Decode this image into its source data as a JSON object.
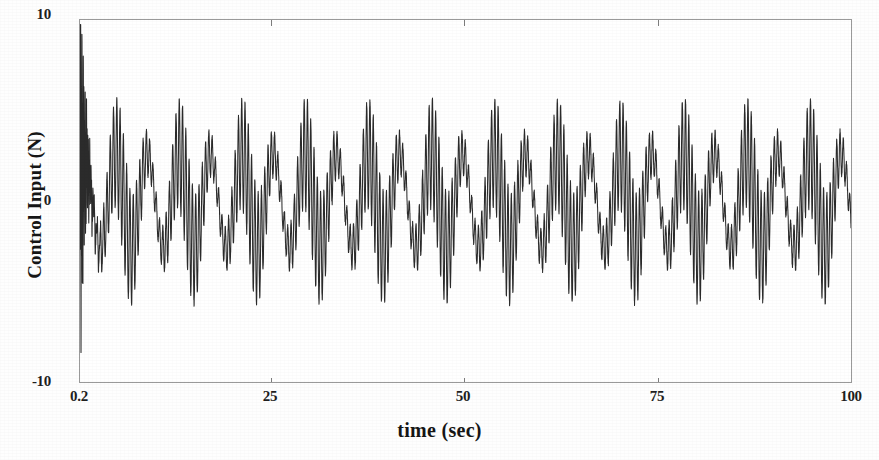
{
  "chart_data": {
    "type": "line",
    "title": "",
    "xlabel": "time (sec)",
    "ylabel": "Control Input (N)",
    "xlim": [
      0.2,
      100
    ],
    "ylim": [
      -10,
      10
    ],
    "xticks": [
      "0.2",
      "25",
      "50",
      "75",
      "100"
    ],
    "xtick_values": [
      0.2,
      25,
      50,
      75,
      100
    ],
    "yticks": [
      "10",
      "0",
      "-10"
    ],
    "ytick_values": [
      10,
      0,
      -10
    ],
    "grid": false,
    "legend": null,
    "line_color": "#2b2b2b",
    "line_width": 1.0,
    "background_color": "#ffffff",
    "axis_color": "#9a9a9a",
    "series": [
      {
        "name": "control input",
        "description": "Saturating oscillatory control signal: a large high-frequency transient burst during the first ~2 seconds reaching +9.5 N and -8.1 N, decaying into a steady-state beating waveform composed of a fast carrier oscillation plus a slower amplitude-modulating wave, bounded within about +5 N and -5 N for the remainder of the record.",
        "transient": {
          "duration_sec": 2.0,
          "max_value": 9.5,
          "min_value": -8.1,
          "carrier_freq_hz": 12.0,
          "decay_time_constant_sec": 0.55
        },
        "steady_state": {
          "start_sec": 2.0,
          "carrier_freq_hz": 2.35,
          "carrier_amplitude": 3.4,
          "modulation_freq_hz": 0.245,
          "modulation_amplitude": 2.6,
          "upper_envelope": 5.2,
          "lower_envelope": -5.2,
          "mean": 0.0
        }
      }
    ]
  },
  "axes": {
    "y_title": "Control Input (N)",
    "x_title": "time (sec)",
    "y_tick_top": "10",
    "y_tick_mid": "0",
    "y_tick_bottom": "-10",
    "x_tick_0": "0.2",
    "x_tick_1": "25",
    "x_tick_2": "50",
    "x_tick_3": "75",
    "x_tick_4": "100"
  }
}
